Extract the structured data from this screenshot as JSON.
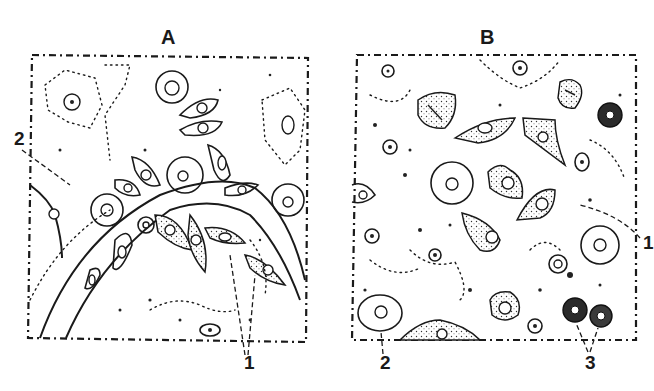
{
  "figure": {
    "panels": [
      {
        "id": "A",
        "title": "A",
        "labels": [
          {
            "text": "2",
            "target": "vessel-wall"
          },
          {
            "text": "1",
            "target": "migrating-cells"
          }
        ]
      },
      {
        "id": "B",
        "title": "B",
        "labels": [
          {
            "text": "1",
            "target": "elongated-cell"
          },
          {
            "text": "2",
            "target": "large-round-cell"
          },
          {
            "text": "3",
            "target": "dark-staining-cells"
          }
        ]
      }
    ],
    "colors": {
      "ink": "#1a1a1a",
      "background": "#ffffff"
    }
  }
}
